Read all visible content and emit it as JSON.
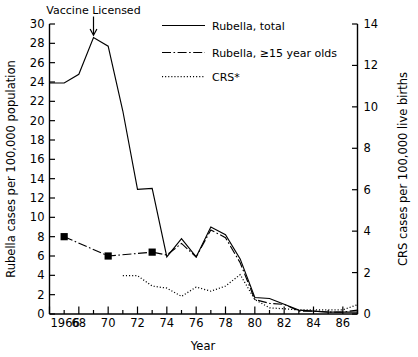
{
  "chart_data": {
    "type": "line",
    "title": "",
    "xlabel": "Year",
    "ylabel": "Rubella cases per 100,000 population",
    "y2label": "CRS cases per 100,000 live births",
    "xlim": [
      1966,
      1987
    ],
    "ylim": [
      0,
      30
    ],
    "y2lim": [
      0,
      14
    ],
    "grid": false,
    "legend_position": "top-right",
    "x_tick_labels": [
      "1966",
      "68",
      "70",
      "72",
      "74",
      "76",
      "78",
      "80",
      "82",
      "84",
      "86"
    ],
    "x_tick_values": [
      1966,
      1968,
      1970,
      1972,
      1974,
      1976,
      1978,
      1980,
      1982,
      1984,
      1986
    ],
    "x_minor_values": [
      1967,
      1969,
      1971,
      1973,
      1975,
      1977,
      1979,
      1981,
      1983,
      1985,
      1987
    ],
    "y_tick_labels": [
      "0",
      "2",
      "4",
      "6",
      "8",
      "10",
      "12",
      "14",
      "16",
      "18",
      "20",
      "22",
      "24",
      "26",
      "28",
      "30"
    ],
    "y_tick_values": [
      0,
      2,
      4,
      6,
      8,
      10,
      12,
      14,
      16,
      18,
      20,
      22,
      24,
      26,
      28,
      30
    ],
    "y2_tick_labels": [
      "0",
      "2",
      "4",
      "6",
      "8",
      "10",
      "12",
      "14"
    ],
    "y2_tick_values": [
      0,
      2,
      4,
      6,
      8,
      10,
      12,
      14
    ],
    "annotations": [
      {
        "name": "vaccine-licensed",
        "text": "Vaccine Licensed",
        "x": 1969,
        "y": 28.6,
        "marker": "down-arrow"
      }
    ],
    "series": [
      {
        "name": "Rubella, total",
        "style": "solid",
        "axis": "left",
        "x": [
          1966,
          1967,
          1968,
          1969,
          1970,
          1971,
          1972,
          1973,
          1974,
          1975,
          1976,
          1977,
          1978,
          1979,
          1980,
          1981,
          1982,
          1983,
          1984,
          1985,
          1986,
          1987
        ],
        "values": [
          23.9,
          23.9,
          24.8,
          28.6,
          27.7,
          21.0,
          12.9,
          13.0,
          5.9,
          7.8,
          5.9,
          9.0,
          8.2,
          5.7,
          1.7,
          1.6,
          1.0,
          0.4,
          0.3,
          0.2,
          0.2,
          0.2
        ]
      },
      {
        "name": "Rubella, ≥15 year olds",
        "style": "dash-dot",
        "axis": "left",
        "markers": "filled-square",
        "marker_x": [
          1967,
          1970,
          1973
        ],
        "marker_values": [
          8.0,
          6.0,
          6.4
        ],
        "x": [
          1967,
          1970,
          1973,
          1974,
          1975,
          1976,
          1977,
          1978,
          1979,
          1980,
          1981,
          1982,
          1983,
          1984,
          1985,
          1986,
          1987
        ],
        "values": [
          8.0,
          6.0,
          6.4,
          6.1,
          7.3,
          5.9,
          8.7,
          7.9,
          5.3,
          1.5,
          1.1,
          1.0,
          0.3,
          0.3,
          0.2,
          0.2,
          0.4
        ]
      },
      {
        "name": "CRS*",
        "style": "dotted",
        "axis": "right",
        "x": [
          1971,
          1972,
          1973,
          1974,
          1975,
          1976,
          1977,
          1978,
          1979,
          1980,
          1981,
          1982,
          1983,
          1984,
          1985,
          1986,
          1987
        ],
        "values": [
          1.85,
          1.85,
          1.35,
          1.25,
          0.85,
          1.3,
          1.1,
          1.35,
          1.9,
          0.7,
          0.3,
          0.25,
          0.2,
          0.2,
          0.2,
          0.2,
          0.45
        ]
      }
    ],
    "legend": [
      {
        "label": "Rubella, total",
        "style": "solid"
      },
      {
        "label": "Rubella, ≥15 year olds",
        "style": "dash-dot"
      },
      {
        "label": "CRS*",
        "style": "dotted"
      }
    ]
  }
}
